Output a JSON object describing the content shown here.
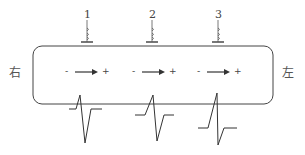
{
  "diagram": {
    "type": "nerve-fiber-conduction",
    "side_labels": {
      "left": "右",
      "right": "左"
    },
    "electrodes": [
      {
        "label": "1",
        "x": 87
      },
      {
        "label": "2",
        "x": 152
      },
      {
        "label": "3",
        "x": 218
      }
    ],
    "current_arrows": [
      {
        "minus": "-",
        "plus": "+",
        "x": 95
      },
      {
        "minus": "-",
        "plus": "+",
        "x": 160
      },
      {
        "minus": "-",
        "plus": "+",
        "x": 225
      }
    ],
    "waveforms": [
      {
        "id": "wave-1",
        "description": "small upward spike then large downward deflection"
      },
      {
        "id": "wave-2",
        "description": "medium upward spike then downward deflection"
      },
      {
        "id": "wave-3",
        "description": "large upward spike then small downward deflection"
      }
    ],
    "colors": {
      "stroke": "#333333",
      "background": "#ffffff"
    }
  }
}
